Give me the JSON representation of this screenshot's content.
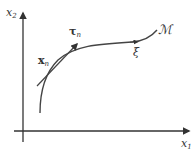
{
  "diagram": {
    "axes": {
      "x_label": "x",
      "x_sub": "1",
      "y_label": "x",
      "y_sub": "2"
    },
    "labels": {
      "manifold": "ℳ",
      "point": "x",
      "point_sub": "n",
      "tangent": "τ",
      "tangent_sub": "n",
      "xi": "ξ"
    },
    "colors": {
      "stroke": "#333333",
      "background": "#ffffff"
    }
  }
}
